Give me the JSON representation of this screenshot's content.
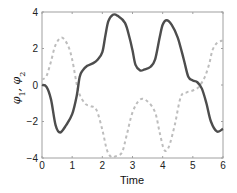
{
  "chart_data": {
    "type": "line",
    "title": "",
    "xlabel": "Time",
    "ylabel": "φ1, φ2",
    "xlim": [
      0,
      6
    ],
    "ylim": [
      -4,
      4
    ],
    "xticks": [
      0,
      1,
      2,
      3,
      4,
      5,
      6
    ],
    "yticks": [
      -4,
      -2,
      0,
      2,
      4
    ],
    "grid": false,
    "legend": null,
    "series": [
      {
        "name": "φ1",
        "style": "solid",
        "color": "#4d4d4d",
        "x": [
          0,
          0.15,
          0.3,
          0.45,
          0.6,
          0.8,
          1.0,
          1.15,
          1.25,
          1.35,
          1.5,
          1.7,
          1.85,
          2.0,
          2.1,
          2.2,
          2.35,
          2.5,
          2.75,
          2.9,
          3.0,
          3.1,
          3.25,
          3.4,
          3.6,
          3.75,
          3.9,
          4.0,
          4.13,
          4.3,
          4.5,
          4.7,
          4.85,
          5.0,
          5.15,
          5.3,
          5.45,
          5.6,
          5.8,
          6.0
        ],
        "y": [
          0.0,
          -0.1,
          -0.8,
          -2.2,
          -2.6,
          -2.2,
          -1.6,
          -0.6,
          0.45,
          0.8,
          1.05,
          1.2,
          1.4,
          1.8,
          2.7,
          3.5,
          3.85,
          3.8,
          3.4,
          2.6,
          1.9,
          1.1,
          0.8,
          0.85,
          1.0,
          1.4,
          2.6,
          3.3,
          3.55,
          3.3,
          2.6,
          1.4,
          0.45,
          0.25,
          0.15,
          -0.2,
          -1.0,
          -2.0,
          -2.55,
          -2.4
        ]
      },
      {
        "name": "φ2",
        "style": "dashed",
        "color": "#bdbdbd",
        "x": [
          0,
          0.15,
          0.3,
          0.45,
          0.65,
          0.85,
          1.0,
          1.2,
          1.42,
          1.6,
          1.8,
          2.0,
          2.15,
          2.3,
          2.45,
          2.65,
          2.8,
          3.0,
          3.25,
          3.5,
          3.75,
          3.9,
          4.05,
          4.2,
          4.4,
          4.6,
          4.8,
          5.0,
          5.2,
          5.4,
          5.55,
          5.65,
          5.8,
          6.0
        ],
        "y": [
          0.3,
          0.5,
          1.3,
          2.2,
          2.6,
          2.2,
          1.4,
          -0.3,
          -1.0,
          -1.15,
          -1.35,
          -2.45,
          -3.55,
          -3.95,
          -3.9,
          -3.7,
          -2.8,
          -1.5,
          -0.8,
          -0.9,
          -1.5,
          -2.6,
          -3.55,
          -3.4,
          -2.2,
          -0.65,
          -0.4,
          -0.3,
          -0.1,
          0.45,
          1.2,
          1.9,
          2.3,
          2.45
        ]
      }
    ]
  },
  "axes": {
    "frame_color": "#a0a0a0"
  }
}
